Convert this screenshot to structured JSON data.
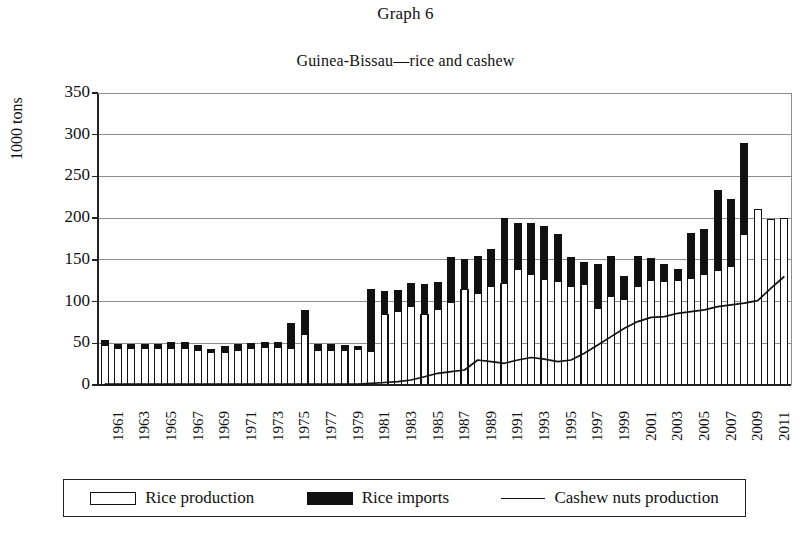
{
  "figure": {
    "title": "Graph 6",
    "subtitle": "Guinea-Bissau—rice and cashew"
  },
  "legend": {
    "items": [
      {
        "label": "Rice production",
        "marker": "open-bar-swatch",
        "color": "#ffffff"
      },
      {
        "label": "Rice imports",
        "marker": "solid-bar-swatch",
        "color": "#111111"
      },
      {
        "label": "Cashew nuts production",
        "marker": "line-swatch",
        "color": "#111111"
      }
    ]
  },
  "chart_data": {
    "type": "bar",
    "title": "Guinea-Bissau—rice and cashew",
    "subtitle": "Graph 6",
    "xlabel": "",
    "ylabel": "1000 tons",
    "ylim": [
      0,
      350
    ],
    "yticks": [
      0,
      50,
      100,
      150,
      200,
      250,
      300,
      350
    ],
    "grid": "horizontal",
    "legend_position": "below-axes",
    "stacked": true,
    "categories": [
      1961,
      1962,
      1963,
      1964,
      1965,
      1966,
      1967,
      1968,
      1969,
      1970,
      1971,
      1972,
      1973,
      1974,
      1975,
      1976,
      1977,
      1978,
      1979,
      1980,
      1981,
      1982,
      1983,
      1984,
      1985,
      1986,
      1987,
      1988,
      1989,
      1990,
      1991,
      1992,
      1993,
      1994,
      1995,
      1996,
      1997,
      1998,
      1999,
      2000,
      2001,
      2002,
      2003,
      2004,
      2005,
      2006,
      2007,
      2008,
      2009,
      2010,
      2011,
      2012
    ],
    "xtick_labels": [
      "1961",
      "1963",
      "1965",
      "1967",
      "1969",
      "1971",
      "1973",
      "1975",
      "1977",
      "1979",
      "1981",
      "1983",
      "1985",
      "1987",
      "1989",
      "1991",
      "1993",
      "1995",
      "1997",
      "1999",
      "2001",
      "2003",
      "2005",
      "2007",
      "2009",
      "2011"
    ],
    "series": [
      {
        "name": "Rice production",
        "style": "bar-open",
        "values": [
          48,
          44,
          44,
          44,
          44,
          44,
          44,
          42,
          39,
          39,
          41,
          44,
          45,
          45,
          44,
          61,
          41,
          42,
          42,
          43,
          40,
          85,
          88,
          94,
          84,
          90,
          99,
          115,
          110,
          118,
          122,
          139,
          132,
          127,
          124,
          118,
          120,
          92,
          106,
          103,
          118,
          125,
          124,
          125,
          128,
          133,
          137,
          142,
          180,
          210,
          198,
          200
        ]
      },
      {
        "name": "Rice imports",
        "style": "bar-solid",
        "values": [
          5,
          5,
          5,
          5,
          5,
          7,
          7,
          5,
          4,
          7,
          7,
          6,
          6,
          6,
          30,
          28,
          7,
          6,
          5,
          3,
          75,
          27,
          25,
          28,
          36,
          33,
          54,
          36,
          44,
          45,
          78,
          55,
          61,
          63,
          56,
          35,
          27,
          52,
          48,
          27,
          36,
          27,
          21,
          13,
          54,
          53,
          96,
          80,
          110,
          0,
          0,
          0
        ]
      },
      {
        "name": "Cashew nuts production",
        "style": "line",
        "values": [
          1,
          1,
          1,
          1,
          1,
          1,
          1,
          1,
          1,
          1,
          1,
          1,
          1,
          1,
          1,
          1,
          1,
          1,
          1,
          1,
          2,
          3,
          4,
          6,
          10,
          14,
          16,
          18,
          30,
          28,
          26,
          30,
          33,
          31,
          28,
          30,
          38,
          48,
          58,
          68,
          76,
          81,
          82,
          86,
          88,
          90,
          94,
          96,
          98,
          101,
          116,
          130
        ]
      }
    ],
    "notes": {
      "bar_total_peak": {
        "year": 2009,
        "value": 290
      },
      "rice_production_peak": {
        "year": 2010,
        "value": 210
      },
      "units": "1000 tons"
    }
  },
  "axes": {
    "y_tick_labels": [
      "350",
      "300",
      "250",
      "200",
      "150",
      "100",
      "50",
      "0"
    ],
    "y_axis_title": "1000 tons"
  }
}
